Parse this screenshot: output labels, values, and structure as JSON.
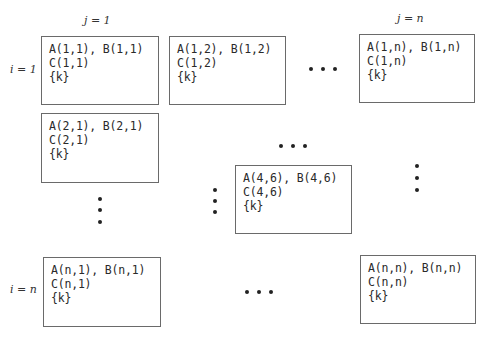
{
  "column_labels": [
    {
      "text": "j = 1",
      "col": "1"
    },
    {
      "text": "j = n",
      "col": "n"
    }
  ],
  "row_labels": [
    {
      "text": "i = 1",
      "row": "1"
    },
    {
      "text": "i = n",
      "row": "n"
    }
  ],
  "cells": {
    "c11": {
      "line1": "A(1,1), B(1,1)",
      "line2": "C(1,1)",
      "line3": "{k}"
    },
    "c12": {
      "line1": "A(1,2), B(1,2)",
      "line2": "C(1,2)",
      "line3": "{k}"
    },
    "c1n": {
      "line1": "A(1,n), B(1,n)",
      "line2": "C(1,n)",
      "line3": "{k}"
    },
    "c21": {
      "line1": "A(2,1), B(2,1)",
      "line2": "C(2,1)",
      "line3": "{k}"
    },
    "c46": {
      "line1": "A(4,6), B(4,6)",
      "line2": "C(4,6)",
      "line3": "{k}"
    },
    "cn1": {
      "line1": "A(n,1), B(n,1)",
      "line2": "C(n,1)",
      "line3": "{k}"
    },
    "cnn": {
      "line1": "A(n,n), B(n,n)",
      "line2": "C(n,n)",
      "line3": "{k}"
    }
  },
  "ellipses": {
    "horizontal": [
      "row-1-between-col-2-and-n",
      "middle-above-cell-4-6",
      "row-n-between-col-1-and-n"
    ],
    "vertical": [
      "below-cell-2-1",
      "left-of-cell-4-6",
      "right-column-between-rows"
    ]
  },
  "colors": {
    "border": "#6a6a6a",
    "text": "#2a2a2a",
    "dots": "#222222",
    "background": "#ffffff"
  }
}
